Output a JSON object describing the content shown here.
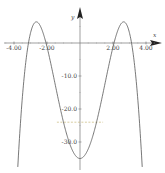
{
  "chart_data": {
    "type": "line",
    "title": "",
    "xlabel": "x",
    "ylabel": "y",
    "xlim": [
      -4.8,
      5.1
    ],
    "ylim": [
      -38.5,
      13
    ],
    "x_ticks": [
      -4.0,
      -2.0,
      2.0,
      4.0
    ],
    "x_tick_labels": [
      "-4.00",
      "-2.00",
      "2.00",
      "4.00"
    ],
    "y_ticks": [
      -10.0,
      -20.0,
      -30.0
    ],
    "y_tick_labels": [
      "-10.0",
      "-20.0",
      "-30.0"
    ],
    "grid": false,
    "legend": null,
    "series": [
      {
        "name": "f(x)",
        "color": "#555555",
        "formula": "-0.845*x^4 + 11.83*x^2 - 35",
        "x": [
          -3.9,
          -3.5,
          -3.12,
          -3.0,
          -2.65,
          -2.3,
          -2.06,
          -1.5,
          -1.0,
          -0.5,
          0.0,
          0.5,
          1.0,
          1.5,
          2.06,
          2.3,
          2.65,
          3.0,
          3.12,
          3.5,
          3.9
        ],
        "y": [
          -36.3,
          -16.8,
          0.0,
          1.1,
          6.4,
          3.5,
          0.0,
          -12.7,
          -24.0,
          -32.1,
          -35.0,
          -32.1,
          -24.0,
          -12.7,
          0.0,
          3.5,
          6.4,
          1.1,
          0.0,
          -16.8,
          -36.3
        ]
      }
    ],
    "annotations": [
      {
        "type": "dashed-hline",
        "y": -24.0,
        "x_from": -1.4,
        "x_to": 1.4,
        "color": "#c8b878"
      }
    ]
  },
  "axes": {
    "x_name": "x",
    "y_name": "y"
  }
}
